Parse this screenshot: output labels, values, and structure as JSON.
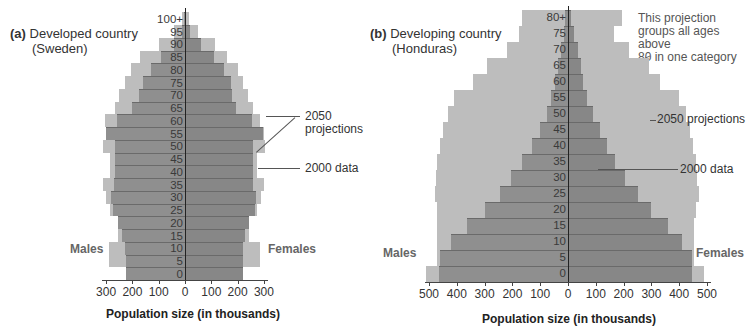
{
  "panels": {
    "a": {
      "letter": "(a)",
      "title_line1": "Developed country",
      "title_line2": "(Sweden)",
      "males_label": "Males",
      "females_label": "Females",
      "xlabel": "Population size (in thousands)",
      "annot_2050": "2050",
      "annot_2050b": "projections",
      "annot_2000": "2000 data",
      "x_ticks": [
        "300",
        "200",
        "100",
        "0",
        "100",
        "200",
        "300"
      ]
    },
    "b": {
      "letter": "(b)",
      "title_line1": "Developing country",
      "title_line2": "(Honduras)",
      "males_label": "Males",
      "females_label": "Females",
      "xlabel": "Population size (in thousands)",
      "annot_2050": "2050 projections",
      "annot_2000": "2000 data",
      "note_line1": "This projection",
      "note_line2": "groups all ages above",
      "note_line3": "80 in one category",
      "x_ticks": [
        "500",
        "400",
        "300",
        "200",
        "100",
        "0",
        "100",
        "200",
        "300",
        "400",
        "500"
      ]
    }
  },
  "colors": {
    "data_2000": "#8f8f8f",
    "projection_2050": "#bdbdbd",
    "axis": "#444444"
  },
  "chart_data": [
    {
      "type": "bar",
      "subtype": "population-pyramid",
      "title": "(a) Developed country (Sweden)",
      "xlabel": "Population size (in thousands)",
      "ylabel": "Age",
      "xlim": [
        -300,
        300
      ],
      "categories": [
        "0",
        "5",
        "10",
        "15",
        "20",
        "25",
        "30",
        "35",
        "40",
        "45",
        "50",
        "55",
        "60",
        "65",
        "70",
        "75",
        "80",
        "85",
        "90",
        "95",
        "100+"
      ],
      "series": [
        {
          "name": "2000 data - Males",
          "values": [
            225,
            225,
            230,
            240,
            255,
            275,
            280,
            270,
            265,
            265,
            265,
            300,
            260,
            200,
            175,
            160,
            130,
            90,
            40,
            10,
            2
          ]
        },
        {
          "name": "2000 data - Females",
          "values": [
            220,
            220,
            220,
            230,
            245,
            265,
            270,
            260,
            260,
            260,
            260,
            295,
            255,
            195,
            180,
            175,
            150,
            110,
            60,
            20,
            4
          ]
        },
        {
          "name": "2050 projections - Males",
          "values": [
            220,
            290,
            290,
            255,
            250,
            285,
            300,
            310,
            285,
            285,
            310,
            300,
            305,
            265,
            250,
            230,
            205,
            170,
            100,
            40,
            10
          ]
        },
        {
          "name": "2050 projections - Females",
          "values": [
            215,
            285,
            285,
            245,
            245,
            275,
            290,
            300,
            275,
            275,
            305,
            300,
            285,
            260,
            240,
            220,
            200,
            160,
            115,
            50,
            15
          ]
        }
      ],
      "legend": [
        "2050 projections",
        "2000 data"
      ],
      "annotations": [
        "Males",
        "Females",
        "2050 projections",
        "2000 data"
      ]
    },
    {
      "type": "bar",
      "subtype": "population-pyramid",
      "title": "(b) Developing country (Honduras)",
      "xlabel": "Population size (in thousands)",
      "ylabel": "Age",
      "xlim": [
        -500,
        500
      ],
      "categories": [
        "0",
        "5",
        "10",
        "15",
        "20",
        "25",
        "30",
        "35",
        "40",
        "45",
        "50",
        "55",
        "60",
        "65",
        "70",
        "75",
        "80+"
      ],
      "series": [
        {
          "name": "2000 data - Males",
          "values": [
            465,
            460,
            420,
            365,
            300,
            245,
            205,
            165,
            130,
            100,
            75,
            60,
            45,
            35,
            25,
            15,
            10
          ]
        },
        {
          "name": "2000 data - Females",
          "values": [
            445,
            445,
            410,
            360,
            300,
            250,
            205,
            170,
            140,
            115,
            90,
            70,
            55,
            45,
            35,
            20,
            10
          ]
        },
        {
          "name": "2050 projections - Males",
          "values": [
            510,
            470,
            470,
            470,
            470,
            480,
            475,
            470,
            460,
            450,
            430,
            410,
            340,
            290,
            220,
            175,
            165
          ]
        },
        {
          "name": "2050 projections - Females",
          "values": [
            490,
            455,
            455,
            455,
            460,
            470,
            465,
            460,
            450,
            440,
            425,
            400,
            330,
            290,
            220,
            165,
            195
          ]
        }
      ],
      "legend": [
        "2050 projections",
        "2000 data"
      ],
      "annotations": [
        "Males",
        "Females",
        "2050 projections",
        "2000 data",
        "This projection groups all ages above 80 in one category"
      ]
    }
  ]
}
